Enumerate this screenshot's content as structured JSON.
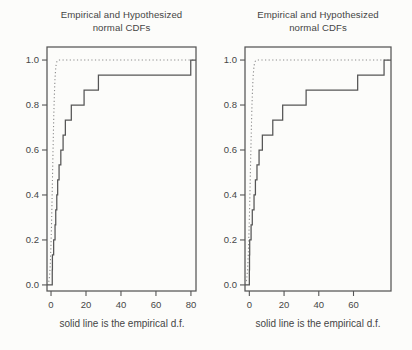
{
  "theme": {
    "background": "#fcfcfa",
    "line_color": "#555555",
    "dotted_color": "#8c8c8c",
    "text_color": "#454545"
  },
  "chart_data": [
    {
      "type": "line",
      "subtype": "cdf-comparison-step-plot",
      "title": "Empirical and Hypothesized normal CDFs",
      "title_line1": "Empirical and Hypothesized",
      "title_line2": "normal CDFs",
      "caption": "solid line is the empirical d.f.",
      "xlabel": "",
      "ylabel": "",
      "grid": false,
      "legend": "none",
      "xlim": [
        -2.3,
        82.9
      ],
      "ylim": [
        -0.027,
        1.058
      ],
      "x_tick_values": [
        0,
        20,
        40,
        60,
        80
      ],
      "x_tick_labels": [
        "0",
        "20",
        "40",
        "60",
        "80"
      ],
      "y_tick_values": [
        0.0,
        0.2,
        0.4,
        0.6,
        0.8,
        1.0
      ],
      "y_tick_labels": [
        "0.0",
        "0.2",
        "0.4",
        "0.6",
        "0.8",
        "1.0"
      ],
      "series": [
        {
          "name": "empirical d.f.",
          "style": "solid-step",
          "n": 15,
          "step_height": "1/15",
          "x_sorted": [
            0.7,
            0.8,
            1.5,
            2.3,
            2.7,
            3.3,
            3.8,
            4.6,
            5.6,
            6.9,
            8.2,
            11.6,
            18.9,
            27.1,
            79.9
          ]
        },
        {
          "name": "hypothesized normal CDF",
          "style": "dotted-curve",
          "mean": 0.9,
          "sd": 1.0
        }
      ]
    },
    {
      "type": "line",
      "subtype": "cdf-comparison-step-plot",
      "title": "Empirical and Hypothesized normal CDFs",
      "title_line1": "Empirical and Hypothesized",
      "title_line2": "normal CDFs",
      "caption": "solid line is the empirical d.f.",
      "xlabel": "",
      "ylabel": "",
      "grid": false,
      "legend": "none",
      "xlim": [
        -2.5,
        81.6
      ],
      "ylim": [
        -0.027,
        1.058
      ],
      "x_tick_values": [
        0,
        20,
        40,
        60
      ],
      "x_tick_labels": [
        "0",
        "20",
        "40",
        "60"
      ],
      "y_tick_values": [
        0.0,
        0.2,
        0.4,
        0.6,
        0.8,
        1.0
      ],
      "y_tick_labels": [
        "0.0",
        "0.2",
        "0.4",
        "0.6",
        "0.8",
        "1.0"
      ],
      "series": [
        {
          "name": "empirical d.f.",
          "style": "solid-step",
          "n": 15,
          "step_height": "1/15",
          "x_sorted": [
            0.0,
            0.1,
            0.2,
            1.0,
            1.7,
            2.7,
            3.5,
            4.4,
            5.6,
            7.5,
            13.5,
            19.2,
            32.7,
            62.4,
            77.6
          ]
        },
        {
          "name": "hypothesized normal CDF",
          "style": "dotted-curve",
          "mean": 0.6,
          "sd": 1.1
        }
      ]
    }
  ]
}
